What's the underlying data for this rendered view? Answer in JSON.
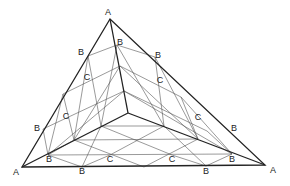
{
  "diagram": {
    "title": "",
    "labels": [
      {
        "text": "A",
        "x": 108,
        "y": 12
      },
      {
        "text": "A",
        "x": 16,
        "y": 172
      },
      {
        "text": "A",
        "x": 273,
        "y": 170
      },
      {
        "text": "B",
        "x": 120,
        "y": 42
      },
      {
        "text": "B",
        "x": 81,
        "y": 52
      },
      {
        "text": "B",
        "x": 158,
        "y": 55
      },
      {
        "text": "C",
        "x": 87,
        "y": 77
      },
      {
        "text": "C",
        "x": 160,
        "y": 80
      },
      {
        "text": "C",
        "x": 66,
        "y": 116
      },
      {
        "text": "C",
        "x": 198,
        "y": 117
      },
      {
        "text": "B",
        "x": 37,
        "y": 128
      },
      {
        "text": "B",
        "x": 234,
        "y": 128
      },
      {
        "text": "B",
        "x": 49,
        "y": 159
      },
      {
        "text": "C",
        "x": 110,
        "y": 159
      },
      {
        "text": "C",
        "x": 172,
        "y": 159
      },
      {
        "text": "B",
        "x": 232,
        "y": 159
      },
      {
        "text": "B",
        "x": 82,
        "y": 171
      },
      {
        "text": "B",
        "x": 206,
        "y": 171
      }
    ]
  }
}
